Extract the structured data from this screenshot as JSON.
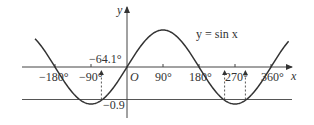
{
  "chart_data": {
    "type": "line",
    "title": "",
    "function_label": "y = sin x",
    "xlabel": "x",
    "ylabel": "y",
    "origin_label": "O",
    "x_unit": "degrees",
    "xlim": [
      -230,
      405
    ],
    "ylim": [
      -1,
      1
    ],
    "x_ticks": [
      {
        "value": -180,
        "label": "−180°"
      },
      {
        "value": -90,
        "label": "−90°"
      },
      {
        "value": 90,
        "label": "90°"
      },
      {
        "value": 180,
        "label": "180°"
      },
      {
        "value": 270,
        "label": "270°"
      },
      {
        "value": 360,
        "label": "360°"
      }
    ],
    "series": [
      {
        "name": "y = sin x",
        "function": "sin",
        "x_range": [
          -230,
          405
        ]
      }
    ],
    "horizontal_lines": [
      {
        "y": -0.9,
        "label": "−0.9"
      }
    ],
    "annotations": [
      {
        "x": -64.1,
        "label": "−64.1°",
        "type": "dashed-vertical-arrow"
      },
      {
        "x": 244.1,
        "label": "",
        "type": "dashed-vertical-arrow"
      },
      {
        "x": 295.9,
        "label": "",
        "type": "dashed-vertical-arrow"
      }
    ],
    "grid": false,
    "legend": "none"
  },
  "labels": {
    "function": "y = sin x",
    "x_axis": "x",
    "y_axis": "y",
    "origin": "O",
    "neg180": "−180°",
    "neg90": "−90°",
    "pos90": "90°",
    "pos180": "180°",
    "pos270": "270°",
    "pos360": "360°",
    "neg64": "−64.1°",
    "neg09": "−0.9"
  },
  "colors": {
    "curve": "#333333",
    "axes": "#444444",
    "text": "#333333",
    "horizontal_line": "#555555"
  }
}
